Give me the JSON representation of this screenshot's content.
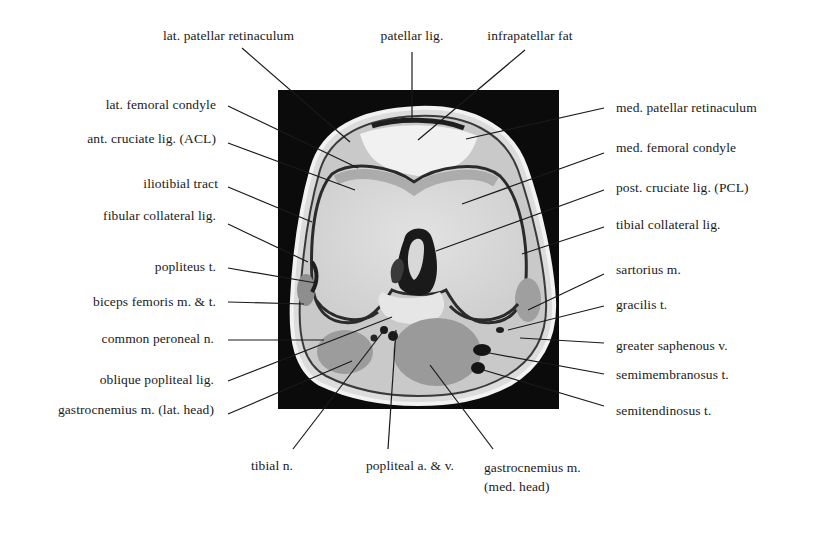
{
  "figure": {
    "image_box": {
      "x": 278,
      "y": 90,
      "w": 281,
      "h": 319
    },
    "colors": {
      "background": "#ffffff",
      "mri_frame": "#0a0a0a",
      "leader_line": "#1a1a1a",
      "text": "#1a1a1a"
    }
  },
  "labels_top": [
    {
      "id": "lat-patellar-retinaculum",
      "text": "lat. patellar retinaculum",
      "x": 294,
      "y": 28,
      "align": "r",
      "line": [
        242,
        48,
        350,
        142
      ]
    },
    {
      "id": "patellar-lig",
      "text": "patellar lig.",
      "x": 412,
      "y": 28,
      "align": "c",
      "line": [
        412,
        52,
        412,
        118
      ]
    },
    {
      "id": "infrapatellar-fat",
      "text": "infrapatellar fat",
      "x": 530,
      "y": 28,
      "align": "c",
      "line": [
        525,
        50,
        418,
        140
      ]
    }
  ],
  "labels_left": [
    {
      "id": "lat-femoral-condyle",
      "text": "lat. femoral condyle",
      "x": 216,
      "y": 97,
      "line": [
        228,
        106,
        358,
        168
      ]
    },
    {
      "id": "acl",
      "text": "ant. cruciate lig. (ACL)",
      "x": 216,
      "y": 131,
      "line": [
        228,
        143,
        355,
        190
      ]
    },
    {
      "id": "iliotibial-tract",
      "text": "iliotibial tract",
      "x": 218,
      "y": 176,
      "line": [
        228,
        187,
        312,
        222
      ]
    },
    {
      "id": "fibular-collateral-lig",
      "text": "fibular collateral lig.",
      "x": 216,
      "y": 208,
      "line": [
        228,
        224,
        308,
        262
      ]
    },
    {
      "id": "popliteus-t",
      "text": "popliteus t.",
      "x": 216,
      "y": 259,
      "line": [
        228,
        268,
        316,
        283
      ]
    },
    {
      "id": "biceps-femoris",
      "text": "biceps femoris m. & t.",
      "x": 216,
      "y": 294,
      "line": [
        228,
        302,
        304,
        304
      ]
    },
    {
      "id": "common-peroneal-n",
      "text": "common peroneal n.",
      "x": 214,
      "y": 331,
      "line": [
        228,
        340,
        324,
        340
      ]
    },
    {
      "id": "oblique-popliteal-lig",
      "text": "oblique popliteal lig.",
      "x": 214,
      "y": 372,
      "line": [
        228,
        381,
        392,
        317
      ]
    },
    {
      "id": "gastrocnemius-lat",
      "text": "gastrocnemius m. (lat. head)",
      "x": 214,
      "y": 402,
      "line": [
        228,
        414,
        352,
        361
      ]
    }
  ],
  "labels_right": [
    {
      "id": "med-patellar-retinaculum",
      "text": "med. patellar retinaculum",
      "x": 616,
      "y": 100,
      "line": [
        604,
        108,
        466,
        139
      ]
    },
    {
      "id": "med-femoral-condyle",
      "text": "med. femoral condyle",
      "x": 616,
      "y": 140,
      "line": [
        604,
        153,
        462,
        204
      ]
    },
    {
      "id": "pcl",
      "text": "post. cruciate lig. (PCL)",
      "x": 616,
      "y": 180,
      "line": [
        604,
        190,
        436,
        251
      ]
    },
    {
      "id": "tibial-collateral-lig",
      "text": "tibial collateral lig.",
      "x": 616,
      "y": 217,
      "line": [
        604,
        227,
        522,
        254
      ]
    },
    {
      "id": "sartorius-m",
      "text": "sartorius m.",
      "x": 616,
      "y": 262,
      "line": [
        604,
        274,
        528,
        310
      ]
    },
    {
      "id": "gracilis-t",
      "text": "gracilis t.",
      "x": 616,
      "y": 297,
      "line": [
        604,
        306,
        508,
        330
      ]
    },
    {
      "id": "greater-saphenous-v",
      "text": "greater saphenous v.",
      "x": 616,
      "y": 338,
      "line": [
        604,
        343,
        520,
        338
      ]
    },
    {
      "id": "semimembranosus-t",
      "text": "semimembranosus t.",
      "x": 616,
      "y": 367,
      "line": [
        604,
        374,
        484,
        352
      ]
    },
    {
      "id": "semitendinosus-t",
      "text": "semitendinosus t.",
      "x": 616,
      "y": 403,
      "line": [
        604,
        406,
        480,
        369
      ]
    }
  ],
  "labels_bottom": [
    {
      "id": "tibial-n",
      "text": "tibial n.",
      "x": 272,
      "y": 458,
      "align": "c",
      "line": [
        293,
        449,
        382,
        333
      ]
    },
    {
      "id": "popliteal-av",
      "text": "popliteal a. & v.",
      "x": 410,
      "y": 458,
      "align": "c",
      "line": [
        388,
        449,
        396,
        330
      ]
    },
    {
      "id": "gastrocnemius-med",
      "text": "gastrocnemius m.",
      "text2": "(med. head)",
      "x": 484,
      "y": 458,
      "align": "ml",
      "line": [
        493,
        449,
        430,
        365
      ]
    }
  ]
}
